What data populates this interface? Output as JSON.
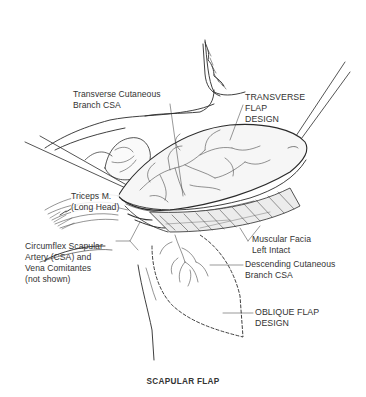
{
  "figure": {
    "title": "SCAPULAR FLAP",
    "colors": {
      "ink": "#2a2a2a",
      "background": "#ffffff",
      "flap_fill": "#f4f4f4",
      "muscle_shade": "#5a5a5a"
    }
  },
  "labels": {
    "transverse_cutaneous_branch": {
      "lines": [
        "Transverse Cutaneous",
        "Branch CSA"
      ]
    },
    "transverse_flap_design": {
      "lines": [
        "TRANSVERSE",
        "FLAP",
        "DESIGN"
      ]
    },
    "triceps": {
      "lines": [
        "Triceps M.",
        "(Long Head)"
      ]
    },
    "circumflex_scapular_artery": {
      "lines": [
        "Circumflex Scapular",
        "Artery (CSA) and",
        "Vena Comitantes",
        "(not shown)"
      ]
    },
    "muscular_facia": {
      "lines": [
        "Muscular Facia",
        "Left Intact"
      ]
    },
    "descending_cutaneous_branch": {
      "lines": [
        "Descending Cutaneous",
        "Branch CSA"
      ]
    },
    "oblique_flap_design": {
      "lines": [
        "OBLIQUE FLAP",
        "DESIGN"
      ]
    }
  }
}
